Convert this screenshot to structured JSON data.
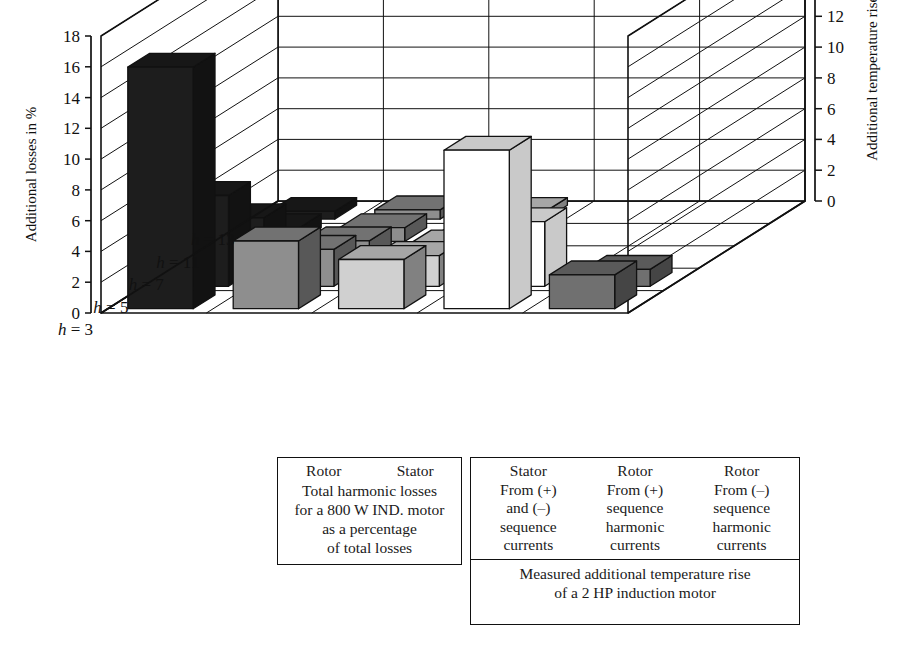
{
  "chart_data": {
    "type": "bar",
    "title": "",
    "subtype": "3d-grouped-bar",
    "xlabel": "",
    "ylabel": "Additional losses in %",
    "y2label": "Additional temperature rise in %",
    "ylim": [
      0,
      18
    ],
    "y2lim": [
      0,
      18
    ],
    "ytick_step": 2,
    "yticks": [
      18,
      16,
      14,
      12,
      10,
      8,
      6,
      4,
      2,
      0
    ],
    "y2ticks": [
      18,
      16,
      14,
      12,
      10,
      8,
      6,
      4,
      2,
      0
    ],
    "grid": true,
    "categories": [
      "h = 3",
      "h = 5",
      "h = 7",
      "h = 11",
      "h = 13"
    ],
    "category_values": [
      3,
      5,
      7,
      11,
      13
    ],
    "series": [
      {
        "name": "Rotor",
        "group": "losses",
        "color": "#1d1d1d",
        "values": [
          15.7,
          5.9,
          3.0,
          0.9,
          0.5
        ]
      },
      {
        "name": "Stator",
        "group": "losses",
        "color": "#8e8e8e",
        "values": [
          4.4,
          2.4,
          1.5,
          0.9,
          0.6
        ]
      },
      {
        "name": "Stator",
        "group": "temperature",
        "color": "#d0d0d0",
        "values": [
          3.2,
          2.0,
          1.3,
          0.8,
          0.5
        ]
      },
      {
        "name": "Rotor",
        "group": "temperature",
        "color": "#ffffff",
        "values": [
          10.3,
          4.2,
          0.0,
          0.0,
          0.0
        ]
      },
      {
        "name": "Rotor",
        "group": "temperature",
        "color": "#707070",
        "values": [
          2.2,
          1.1,
          0.0,
          0.0,
          0.0
        ]
      }
    ]
  },
  "axes": {
    "left_title": "Additional losses in %",
    "right_title": "Additional temperature rise in %",
    "left_ticks": [
      "18",
      "16",
      "14",
      "12",
      "10",
      "8",
      "6",
      "4",
      "2",
      "0"
    ],
    "right_ticks": [
      "18",
      "16",
      "14",
      "12",
      "10",
      "8",
      "6",
      "4",
      "2",
      "0"
    ],
    "depth_labels": [
      "h = 3",
      "h = 5",
      "h = 7",
      "h = 11",
      "h = 13"
    ]
  },
  "legend_left": {
    "headers": [
      "Rotor",
      "Stator"
    ],
    "caption_lines": [
      "Total harmonic losses",
      "for a 800 W IND. motor",
      "as a percentage",
      "of total losses"
    ]
  },
  "legend_right": {
    "columns": [
      {
        "header": "Stator",
        "lines": [
          "From (+)",
          "and (–)",
          "sequence",
          "currents"
        ]
      },
      {
        "header": "Rotor",
        "lines": [
          "From (+)",
          "sequence",
          "harmonic",
          "currents"
        ]
      },
      {
        "header": "Rotor",
        "lines": [
          "From (–)",
          "sequence",
          "harmonic",
          "currents"
        ]
      }
    ],
    "caption_lines": [
      "Measured additional temperature rise",
      "of a 2 HP induction motor"
    ]
  },
  "colors": {
    "ink": "#111111",
    "series_rotor_losses": "#1d1d1d",
    "series_stator_losses": "#8e8e8e",
    "series_stator_temp": "#d0d0d0",
    "series_rotor_plus_temp": "#ffffff",
    "series_rotor_minus_temp": "#707070"
  }
}
